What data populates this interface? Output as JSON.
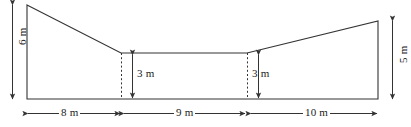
{
  "figure": {
    "units": "m",
    "stroke_color": "#333333",
    "background_color": "#ffffff",
    "shape": {
      "name": "valley-cross-section",
      "description": "Closed polygon: tall left wall, descending slope, flat base channel, ascending slope, shorter right wall, long bottom edge"
    },
    "dimensions": {
      "left_height": "6 m",
      "right_height": "5 m",
      "inner_depth_left": "3 m",
      "inner_depth_right": "3 m",
      "base_left": "8 m",
      "base_middle": "9 m",
      "base_right": "10 m"
    },
    "values": {
      "left_height": 6,
      "right_height": 5,
      "inner_depth_left": 3,
      "inner_depth_right": 3,
      "base_left": 8,
      "base_middle": 9,
      "base_right": 10
    }
  }
}
